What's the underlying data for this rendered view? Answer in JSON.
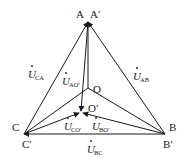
{
  "diagram": {
    "type": "phasor-diagram",
    "points": {
      "A": {
        "label": "A",
        "x": 88,
        "y": 22
      },
      "A_prime": {
        "label": "A′",
        "x": 88,
        "y": 22
      },
      "B": {
        "label": "B",
        "x": 165,
        "y": 134
      },
      "B_prime": {
        "label": "B′",
        "x": 165,
        "y": 134
      },
      "C": {
        "label": "C",
        "x": 24,
        "y": 134
      },
      "C_prime": {
        "label": "C′",
        "x": 24,
        "y": 134
      },
      "O": {
        "label": "O",
        "x": 88,
        "y": 88
      },
      "O_prime": {
        "label": "O′",
        "x": 81,
        "y": 112
      }
    },
    "vectors": {
      "U_AB": {
        "symbol": "U",
        "subscript": "AB"
      },
      "U_CA": {
        "symbol": "U",
        "subscript": "CA"
      },
      "U_BC": {
        "symbol": "U",
        "subscript": "BC"
      },
      "U_AO": {
        "symbol": "U",
        "subscript": "AO′"
      },
      "U_BO": {
        "symbol": "U",
        "subscript": "BO′"
      },
      "U_CO": {
        "symbol": "U",
        "subscript": "CO′"
      }
    },
    "colors": {
      "stroke": "#1a1a1a",
      "background": "#ffffff"
    }
  }
}
